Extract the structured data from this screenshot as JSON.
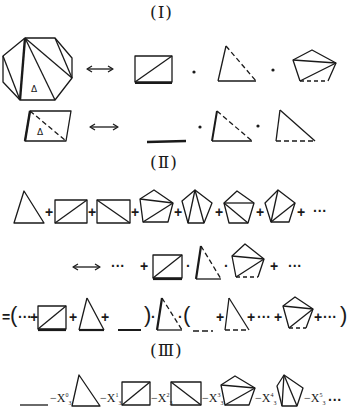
{
  "sections": {
    "one": {
      "label": "(Ⅰ)"
    },
    "two": {
      "label": "(Ⅱ)"
    },
    "three": {
      "label": "(Ⅲ)"
    }
  },
  "symbols": {
    "plus": "+",
    "dot": "·",
    "ellipsis": "···",
    "equals": "=",
    "minus": "−",
    "open_paren": "(",
    "close_paren": ")",
    "arrow": "↔"
  },
  "series_three": {
    "terms": [
      {
        "var": "X",
        "sup": "0",
        "sub": "3"
      },
      {
        "var": "X",
        "sup": "1",
        "sub": "3"
      },
      {
        "var": "X",
        "sup": "2",
        "sub": "3"
      },
      {
        "var": "X",
        "sup": "3",
        "sub": "3"
      },
      {
        "var": "X",
        "sup": "4",
        "sub": "3"
      },
      {
        "var": "X",
        "sup": "5",
        "sub": "3"
      }
    ],
    "trailing": "···"
  },
  "colors": {
    "ink": "#1a1a1a",
    "paper": "#ffffff"
  }
}
